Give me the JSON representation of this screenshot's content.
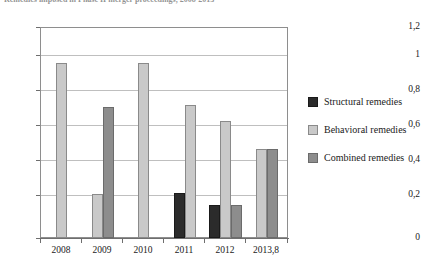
{
  "caption": {
    "text": "Remedies imposed in Phase II merger proceedings, 2008-2013"
  },
  "chart_data": {
    "type": "bar",
    "title": "",
    "subtitle": "",
    "xlabel": "",
    "ylabel": "",
    "categories": [
      "2008",
      "2009",
      "2010",
      "2011",
      "2012",
      "2013,8"
    ],
    "series": [
      {
        "name": "Structural remedies",
        "color": "#2b2b2b",
        "values": [
          0,
          0,
          0,
          0.26,
          0.19,
          0
        ]
      },
      {
        "name": "Behavioral remedies",
        "color": "#c9c9c9",
        "values": [
          1.0,
          0.25,
          1.0,
          0.76,
          0.67,
          0.51
        ]
      },
      {
        "name": "Combined remedies",
        "color": "#8d8d8d",
        "values": [
          0,
          0.75,
          0,
          0,
          0.19,
          0.51
        ]
      }
    ],
    "ylim": [
      0,
      1.2
    ],
    "ytick_labels": [
      "0",
      "0,2",
      "0,4",
      "0,6",
      "0,8",
      "1",
      "1,2"
    ],
    "ytick_values": [
      0,
      0.2,
      0.4,
      0.6,
      0.8,
      1.0,
      1.2
    ],
    "grid": true,
    "legend_position": "right",
    "decimal_separator": ","
  },
  "legend": {
    "items": [
      {
        "label": "Structural remedies",
        "key": "structural"
      },
      {
        "label": "Behavioral remedies",
        "key": "behavioral"
      },
      {
        "label": "Combined remedies",
        "key": "combined"
      }
    ]
  }
}
